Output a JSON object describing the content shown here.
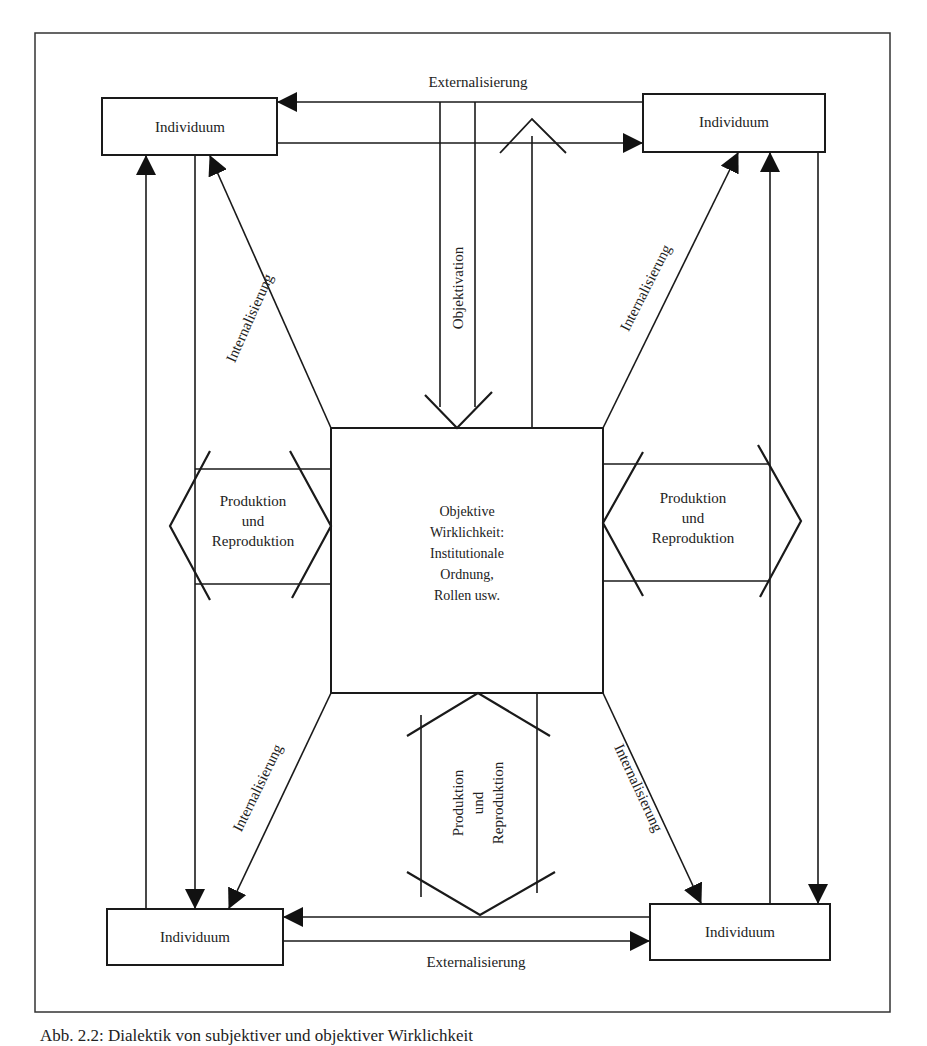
{
  "diagram": {
    "center": {
      "lines": [
        "Objektive",
        "Wirklichkeit:",
        "Institutionale",
        "Ordnung,",
        "Rollen usw."
      ]
    },
    "nodes": {
      "top_left": "Individuum",
      "top_right": "Individuum",
      "bottom_left": "Individuum",
      "bottom_right": "Individuum"
    },
    "labels": {
      "externalisierung_top": "Externalisierung",
      "externalisierung_bottom": "Externalisierung",
      "objektivation": "Objektivation",
      "internalisierung_tl": "Internalisierung",
      "internalisierung_tr": "Internalisierung",
      "internalisierung_bl": "Internalisierung",
      "internalisierung_br": "Internalisierung"
    },
    "produktion": {
      "left": [
        "Produktion",
        "und",
        "Reproduktion"
      ],
      "right": [
        "Produktion",
        "und",
        "Reproduktion"
      ],
      "bottom": [
        "Produktion",
        "und",
        "Reproduktion"
      ]
    }
  },
  "caption": "Abb. 2.2: Dialektik von subjektiver und objektiver Wirklichkeit",
  "colors": {
    "ink": "#1a1a1a",
    "background": "#ffffff"
  }
}
